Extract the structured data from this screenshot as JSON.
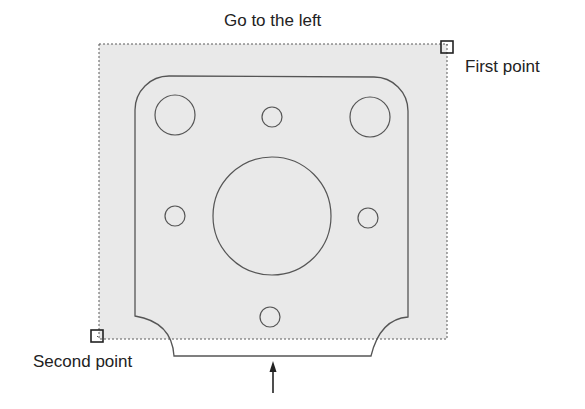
{
  "title": "Go to the left",
  "labels": {
    "first_point": "First point",
    "second_point": "Second point"
  },
  "selection_window": {
    "x1": 99,
    "y1": 44,
    "x2": 447,
    "y2": 339,
    "fill": "#e8e8e8",
    "border_style": "dotted",
    "border_color": "#555555"
  },
  "markers": {
    "first_point": {
      "x": 447,
      "y": 47,
      "size": 13
    },
    "second_point": {
      "x": 97,
      "y": 336,
      "size": 13
    }
  },
  "part_outline": {
    "stroke": "#555555",
    "top_y": 76,
    "left_x": 135,
    "right_x": 408,
    "corner_radius": 34,
    "notch_bottom_y": 356,
    "left_notch_end_y": 316,
    "right_notch_end_y": 317,
    "bottom_left_x": 174,
    "bottom_right_x": 371
  },
  "holes": [
    {
      "name": "top-left-hole",
      "cx": 175,
      "cy": 115,
      "r": 20
    },
    {
      "name": "top-right-hole",
      "cx": 370,
      "cy": 117,
      "r": 20
    },
    {
      "name": "top-center-hole",
      "cx": 272,
      "cy": 117,
      "r": 10
    },
    {
      "name": "center-bore",
      "cx": 272,
      "cy": 216,
      "r": 59
    },
    {
      "name": "left-hole",
      "cx": 175,
      "cy": 216,
      "r": 10
    },
    {
      "name": "right-hole",
      "cx": 368,
      "cy": 218,
      "r": 10
    },
    {
      "name": "bottom-hole",
      "cx": 270,
      "cy": 317,
      "r": 10
    }
  ],
  "arrow": {
    "x": 273,
    "y_tip": 362,
    "y_tail": 393,
    "direction": "up"
  }
}
